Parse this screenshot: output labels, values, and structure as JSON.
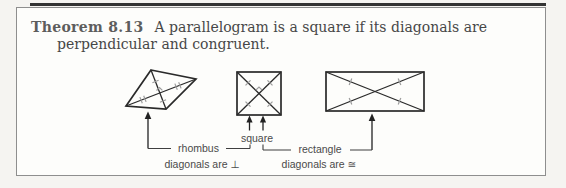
{
  "theorem": {
    "label": "Theorem 8.13",
    "statement_line1": "A parallelogram is a square if its diagonals are",
    "statement_line2": "perpendicular and congruent."
  },
  "diagram": {
    "shapes": [
      {
        "name": "rhombus",
        "label": "rhombus",
        "note": "diagonals are ⊥"
      },
      {
        "name": "square",
        "label": "square"
      },
      {
        "name": "rectangle",
        "label": "rectangle",
        "note": "diagonals are ≅"
      }
    ]
  },
  "colors": {
    "top_rule": "#333333",
    "frame_border": "#8e8e8e",
    "heading_text": "#5d5d5d",
    "body_text": "#474747",
    "line_ink": "#2a2a2a",
    "tick_mark": "#9c9c9c",
    "label_text": "#4a4a4a",
    "panel_bg": "#fdfdfb",
    "page_bg": "#f5f4f1"
  }
}
